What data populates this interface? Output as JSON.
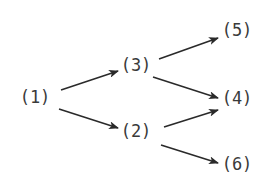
{
  "diagram": {
    "type": "directed-tree",
    "nodes": [
      {
        "id": "1",
        "label": "(1)",
        "x": 35,
        "y": 97
      },
      {
        "id": "3",
        "label": "(3)",
        "x": 136,
        "y": 65
      },
      {
        "id": "2",
        "label": "(2)",
        "x": 136,
        "y": 131
      },
      {
        "id": "5",
        "label": "(5)",
        "x": 237,
        "y": 30
      },
      {
        "id": "4",
        "label": "(4)",
        "x": 237,
        "y": 98
      },
      {
        "id": "6",
        "label": "(6)",
        "x": 237,
        "y": 164
      }
    ],
    "edges": [
      {
        "from": "1",
        "to": "3",
        "x1": 61,
        "y1": 90,
        "x2": 118,
        "y2": 71
      },
      {
        "from": "1",
        "to": "2",
        "x1": 59,
        "y1": 109,
        "x2": 118,
        "y2": 128
      },
      {
        "from": "3",
        "to": "5",
        "x1": 159,
        "y1": 59,
        "x2": 218,
        "y2": 38
      },
      {
        "from": "3",
        "to": "4",
        "x1": 153,
        "y1": 77,
        "x2": 218,
        "y2": 98
      },
      {
        "from": "2",
        "to": "4",
        "x1": 164,
        "y1": 127,
        "x2": 218,
        "y2": 110
      },
      {
        "from": "2",
        "to": "6",
        "x1": 161,
        "y1": 145,
        "x2": 218,
        "y2": 163
      }
    ],
    "colors": {
      "edge": "#2a2a2a",
      "text": "#3a3a3a",
      "background": "#ffffff"
    }
  }
}
